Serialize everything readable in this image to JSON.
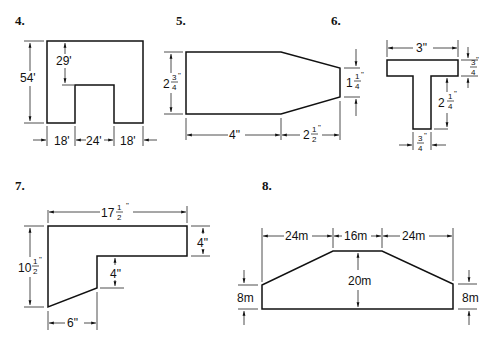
{
  "page": {
    "background": "#ffffff",
    "ink": "#111111"
  },
  "figures": [
    {
      "number": "4.",
      "shape": "rectangle with notch",
      "dimensions": {
        "height": "54'",
        "notch_depth": "29'",
        "left_base": "18'",
        "notch_width": "24'",
        "right_base": "18'"
      }
    },
    {
      "number": "5.",
      "shape": "rectangle with tapered end",
      "dimensions": {
        "height_whole": "2",
        "height_num": "3",
        "height_den": "4",
        "height_unit": "\"",
        "right_height_whole": "1",
        "right_height_num": "1",
        "right_height_den": "4",
        "right_height_unit": "\"",
        "length": "4\"",
        "taper_whole": "2",
        "taper_num": "1",
        "taper_den": "2",
        "taper_unit": "\""
      }
    },
    {
      "number": "6.",
      "shape": "T-section",
      "dimensions": {
        "width": "3\"",
        "flange_num": "3",
        "flange_den": "4",
        "flange_unit": "\"",
        "stem_height_whole": "2",
        "stem_height_num": "1",
        "stem_height_den": "4",
        "stem_height_unit": "\"",
        "stem_width_num": "3",
        "stem_width_den": "4",
        "stem_width_unit": "\""
      }
    },
    {
      "number": "7.",
      "shape": "L-shape with slanted bottom",
      "dimensions": {
        "width_whole": "17",
        "width_num": "1",
        "width_den": "2",
        "width_unit": "\"",
        "height_whole": "10",
        "height_num": "1",
        "height_den": "2",
        "height_unit": "\"",
        "top_arm": "4\"",
        "inner_step": "4\"",
        "bottom_width": "6\""
      }
    },
    {
      "number": "8.",
      "shape": "trapezoidal embankment",
      "dimensions": {
        "left_slope": "24m",
        "top": "16m",
        "right_slope": "24m",
        "center_height": "20m",
        "left_side": "8m",
        "right_side": "8m"
      }
    }
  ]
}
